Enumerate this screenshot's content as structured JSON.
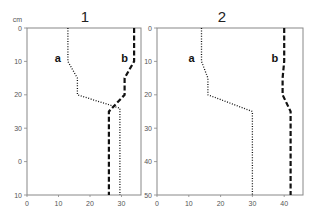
{
  "chart_data": [
    {
      "type": "line",
      "title": "1",
      "ylabel": "cm",
      "xlabel": "",
      "y_ticks": [
        "0",
        "10",
        "20",
        "30",
        "0",
        "10"
      ],
      "x_ticks": [
        "0",
        "10",
        "20",
        "30"
      ],
      "xlim": [
        0,
        35
      ],
      "ylim": [
        50,
        0
      ],
      "y_inverted": true,
      "grid": false,
      "series": [
        {
          "name": "a",
          "style": "dotted",
          "points": [
            [
              13,
              0
            ],
            [
              13,
              10
            ],
            [
              16,
              15
            ],
            [
              16,
              20
            ],
            [
              29.5,
              24
            ],
            [
              29.5,
              50
            ]
          ]
        },
        {
          "name": "b",
          "style": "dashed",
          "points": [
            [
              34,
              0
            ],
            [
              34,
              10
            ],
            [
              31,
              15
            ],
            [
              31,
              20
            ],
            [
              26,
              25
            ],
            [
              26,
              50
            ]
          ]
        }
      ]
    },
    {
      "type": "line",
      "title": "2",
      "ylabel": "",
      "xlabel": "",
      "y_ticks": [
        "0",
        "10",
        "20",
        "30",
        "40",
        "50"
      ],
      "x_ticks": [
        "0",
        "10",
        "20",
        "30",
        "40"
      ],
      "xlim": [
        0,
        46
      ],
      "ylim": [
        50,
        0
      ],
      "y_inverted": true,
      "grid": false,
      "series": [
        {
          "name": "a",
          "style": "dotted",
          "points": [
            [
              14,
              0
            ],
            [
              14,
              10
            ],
            [
              16,
              15
            ],
            [
              16,
              20
            ],
            [
              30,
              25
            ],
            [
              30,
              50
            ]
          ]
        },
        {
          "name": "b",
          "style": "dashed",
          "points": [
            [
              40,
              0
            ],
            [
              40,
              10
            ],
            [
              39.5,
              15
            ],
            [
              39.5,
              20
            ],
            [
              42,
              25
            ],
            [
              42,
              50
            ]
          ]
        }
      ]
    }
  ],
  "labels": {
    "unit": "cm",
    "panel1_title": "1",
    "panel2_title": "2",
    "curve_a": "a",
    "curve_b": "b"
  }
}
